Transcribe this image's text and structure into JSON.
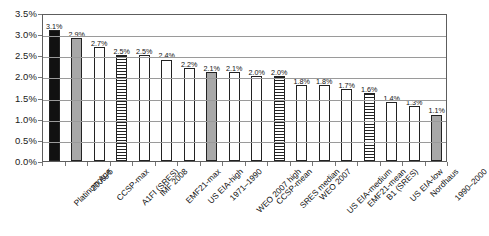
{
  "chart_data": {
    "type": "bar",
    "title": "",
    "xlabel": "",
    "ylabel": "",
    "ylim": [
      0,
      3.5
    ],
    "ytick_labels": [
      "3.5%",
      "3.0%",
      "2.5%",
      "2.0%",
      "1.5%",
      "1.0%",
      "0.5%",
      "0.0%"
    ],
    "ytick_values": [
      3.5,
      3.0,
      2.5,
      2.0,
      1.5,
      1.0,
      0.5,
      0.0
    ],
    "grid": true,
    "legend": "none",
    "value_suffix": "%",
    "categories": [
      "Platinum Age",
      "2000–5",
      "CCSP-max",
      "A1FI (SRES)",
      "IMF 2008",
      "EMF21-max",
      "US EIA-high",
      "1971–1990",
      "WEO 2007 high",
      "CCSP-mean",
      "SRES median",
      "WEO 2007",
      "US EIA-medium",
      "EMF21-mean",
      "B1 (SRES)",
      "US EIA-low",
      "Nordhaus",
      "1990–2000"
    ],
    "values": [
      3.1,
      2.9,
      2.7,
      2.5,
      2.5,
      2.4,
      2.2,
      2.1,
      2.1,
      2.0,
      2.0,
      1.8,
      1.8,
      1.7,
      1.6,
      1.4,
      1.3,
      1.1
    ],
    "value_labels": [
      "3.1%",
      "2.9%",
      "2.7%",
      "2.5%",
      "2.5%",
      "2.4%",
      "2.2%",
      "2.1%",
      "2.1%",
      "2.0%",
      "2.0%",
      "1.8%",
      "1.8%",
      "1.7%",
      "1.6%",
      "1.4%",
      "1.3%",
      "1.1%"
    ],
    "bar_styles": [
      "black",
      "gray",
      "white",
      "stripe",
      "white",
      "white",
      "white",
      "gray",
      "white",
      "white",
      "stripe",
      "white",
      "white",
      "white",
      "stripe",
      "white",
      "white",
      "gray"
    ],
    "colors": {
      "black": "#111111",
      "gray": "#a8a8a8",
      "white": "#ffffff",
      "stripe_line": "#222222",
      "axis": "#5d5d5d",
      "gridline": "#9a9a9a"
    }
  }
}
